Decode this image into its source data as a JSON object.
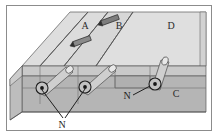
{
  "figure": {
    "kind": "3d-block-diagram",
    "title": "",
    "frame": {
      "border_color": "#8c8c8c",
      "background": "#ffffff"
    }
  },
  "palette": {
    "top_surface_light": "#e2e2e2",
    "top_surface_mid": "#d9d9d9",
    "top_surface_band": "#d2d2d2",
    "front_face": "#b7b7b7",
    "front_face_dark": "#a9a9a9",
    "left_face": "#bdbdbd",
    "side_step": "#c9c9c9",
    "cylinder_body": "#cfcfcf",
    "cylinder_top": "#e6e6e6",
    "outline": "#4a4a4a",
    "label_color": "#2b2b2b",
    "leader_color": "#1f1f1f"
  },
  "labels": {
    "surface": [
      {
        "id": "label-a",
        "text": "A",
        "x": 85,
        "y": 29
      },
      {
        "id": "label-b",
        "text": "B",
        "x": 119,
        "y": 29
      },
      {
        "id": "label-d",
        "text": "D",
        "x": 171,
        "y": 29
      }
    ],
    "front": [
      {
        "id": "label-c",
        "text": "C",
        "x": 176,
        "y": 97
      }
    ],
    "callouts": [
      {
        "id": "callout-n-left",
        "text": "N",
        "x": 62,
        "y": 125
      },
      {
        "id": "callout-n-right",
        "text": "N",
        "x": 127,
        "y": 98
      }
    ]
  },
  "features": {
    "cylinders": [
      {
        "id": "cylinder-1",
        "label_ref": "N",
        "cap_cx": 42,
        "cap_cy": 88
      },
      {
        "id": "cylinder-2",
        "label_ref": "N",
        "cap_cx": 85,
        "cap_cy": 87
      },
      {
        "id": "cylinder-3",
        "label_ref": "N",
        "cap_cx": 155,
        "cap_cy": 84
      }
    ],
    "slip_arrows": [
      {
        "id": "slip-arrow-upper",
        "x": 110,
        "y": 20
      },
      {
        "id": "slip-arrow-lower",
        "x": 82,
        "y": 41
      }
    ]
  },
  "legend": {
    "n_meaning": "N",
    "region_labels": [
      "A",
      "B",
      "C",
      "D"
    ]
  }
}
